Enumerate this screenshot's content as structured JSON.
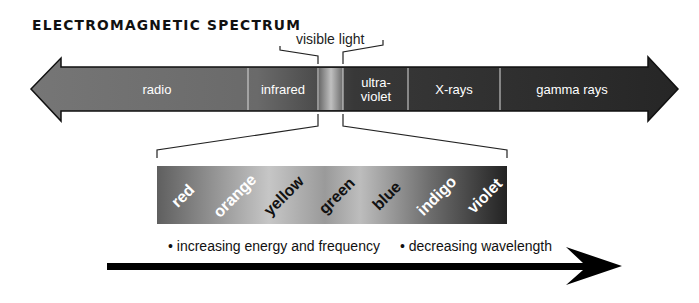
{
  "title": "ELECTROMAGNETIC SPECTRUM",
  "visible_light_label": "visible light",
  "spectrum_regions": [
    {
      "label": "radio"
    },
    {
      "label": "infrared"
    },
    {
      "label": "visible"
    },
    {
      "label_line1": "ultra-",
      "label_line2": "violet"
    },
    {
      "label": "X-rays"
    },
    {
      "label": "gamma rays"
    }
  ],
  "visible_colors": [
    "red",
    "orange",
    "yellow",
    "green",
    "blue",
    "indigo",
    "violet"
  ],
  "bottom_notes": {
    "note1": "• increasing energy and frequency",
    "note2": "• decreasing wavelength"
  },
  "colors": {
    "arrow_left": "#6f6f6f",
    "arrow_right": "#2a2a2a",
    "visible_band_start": "#5f5f5f",
    "visible_band_end": "#232323"
  }
}
